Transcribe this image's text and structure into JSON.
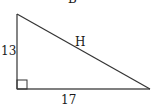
{
  "diagram": {
    "type": "right-triangle",
    "top_label": "B",
    "sides": {
      "vertical_leg": "13",
      "horizontal_leg": "17",
      "hypotenuse": "H"
    },
    "right_angle_marker": "bottom-left",
    "stroke_color": "#333333"
  }
}
